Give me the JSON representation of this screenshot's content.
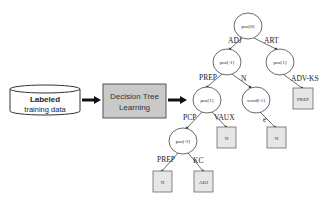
{
  "input": {
    "line1": "Labeled",
    "line2": "training data"
  },
  "process": {
    "line1": "Decision Tree",
    "line2": "Learning"
  },
  "tree": {
    "nodes": {
      "root": "pos[0]",
      "left": "pos[-1]",
      "right": "pos[1]",
      "left_left": "pos[1]",
      "left_right": "word[-1]",
      "left_left_left": "pos[-2]"
    },
    "leaves": {
      "right_leaf": "PREP",
      "vaux_leaf": "N",
      "e_leaf": "N",
      "prep_leaf": "N",
      "kc_leaf": "ADJ"
    },
    "edges": {
      "root_left": "ADJ",
      "root_right": "ART",
      "left_left": "PREP",
      "left_right": "N",
      "right_leaf": "ADV-KS",
      "mid_pcp": "PCP",
      "mid_vaux": "VAUX",
      "word_e": "e",
      "pos2_prep": "PREP",
      "pos2_kc": "KC"
    }
  }
}
